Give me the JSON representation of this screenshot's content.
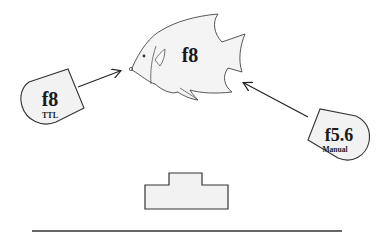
{
  "diagram": {
    "subject": {
      "label": "f8",
      "shape": "angelfish"
    },
    "strobe_left": {
      "aperture": "f8",
      "mode": "TTL"
    },
    "strobe_right": {
      "aperture": "f5.6",
      "mode": "Manual"
    },
    "camera": {
      "shape": "camera-body-outline"
    },
    "colors": {
      "fill": "#f2f2f2",
      "stroke": "#333333",
      "text": "#1a1a1a",
      "background": "#ffffff"
    }
  }
}
